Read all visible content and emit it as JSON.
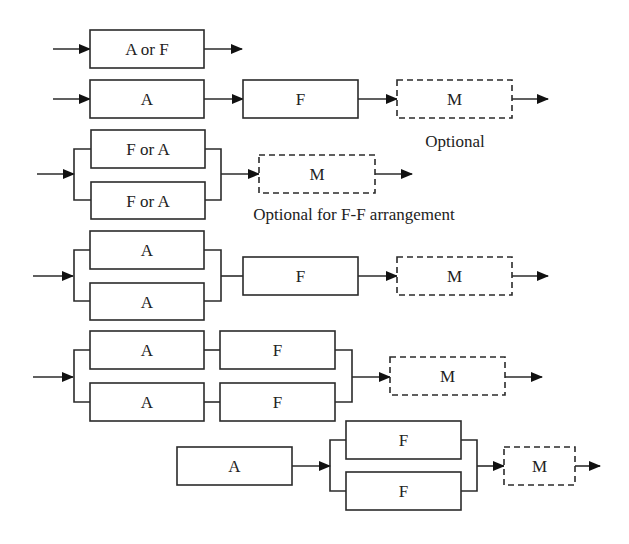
{
  "diagram": {
    "colors": {
      "stroke": "#2b2b2b",
      "text": "#222222",
      "background": "#ffffff"
    },
    "rows": [
      {
        "id": "row-1",
        "boxes": [
          {
            "id": "r1-a-or-f",
            "label": "A or F",
            "x": 90,
            "y": 30,
            "w": 114,
            "h": 38,
            "dashed": false
          }
        ],
        "wires": [
          {
            "pts": [
              [
                53,
                49
              ],
              [
                90,
                49
              ]
            ],
            "arrow": true
          },
          {
            "pts": [
              [
                204,
                49
              ],
              [
                242,
                49
              ]
            ],
            "arrow": true
          }
        ]
      },
      {
        "id": "row-2",
        "boxes": [
          {
            "id": "r2-a",
            "label": "A",
            "x": 90,
            "y": 80,
            "w": 114,
            "h": 38,
            "dashed": false
          },
          {
            "id": "r2-f",
            "label": "F",
            "x": 243,
            "y": 80,
            "w": 115,
            "h": 38,
            "dashed": false
          },
          {
            "id": "r2-m",
            "label": "M",
            "x": 397,
            "y": 80,
            "w": 115,
            "h": 38,
            "dashed": true
          }
        ],
        "wires": [
          {
            "pts": [
              [
                53,
                99
              ],
              [
                90,
                99
              ]
            ],
            "arrow": true
          },
          {
            "pts": [
              [
                204,
                99
              ],
              [
                243,
                99
              ]
            ],
            "arrow": true
          },
          {
            "pts": [
              [
                358,
                99
              ],
              [
                397,
                99
              ]
            ],
            "arrow": true
          },
          {
            "pts": [
              [
                512,
                99
              ],
              [
                548,
                99
              ]
            ],
            "arrow": true
          }
        ],
        "notes": [
          {
            "text": "Optional",
            "x": 455,
            "y": 147
          }
        ]
      },
      {
        "id": "row-3",
        "boxes": [
          {
            "id": "r3-f-or-a-top",
            "label": "F or A",
            "x": 91,
            "y": 130,
            "w": 114,
            "h": 38,
            "dashed": false
          },
          {
            "id": "r3-f-or-a-bottom",
            "label": "F or A",
            "x": 91,
            "y": 182,
            "w": 114,
            "h": 37,
            "dashed": false
          },
          {
            "id": "r3-m",
            "label": "M",
            "x": 259,
            "y": 155,
            "w": 116,
            "h": 38,
            "dashed": true
          }
        ],
        "wires": [
          {
            "pts": [
              [
                37,
                174
              ],
              [
                74,
                174
              ]
            ],
            "arrow": true
          },
          {
            "pts": [
              [
                91,
                149
              ],
              [
                74,
                149
              ],
              [
                74,
                200
              ],
              [
                91,
                200
              ]
            ],
            "arrow": false
          },
          {
            "pts": [
              [
                205,
                149
              ],
              [
                221,
                149
              ],
              [
                221,
                200
              ],
              [
                205,
                200
              ]
            ],
            "arrow": false
          },
          {
            "pts": [
              [
                221,
                174
              ],
              [
                259,
                174
              ]
            ],
            "arrow": true
          },
          {
            "pts": [
              [
                375,
                174
              ],
              [
                412,
                174
              ]
            ],
            "arrow": true
          }
        ],
        "notes": [
          {
            "text": "Optional for F-F arrangement",
            "x": 354,
            "y": 220
          }
        ]
      },
      {
        "id": "row-4",
        "boxes": [
          {
            "id": "r4-a-top",
            "label": "A",
            "x": 90,
            "y": 231,
            "w": 114,
            "h": 38,
            "dashed": false
          },
          {
            "id": "r4-a-bottom",
            "label": "A",
            "x": 90,
            "y": 283,
            "w": 114,
            "h": 37,
            "dashed": false
          },
          {
            "id": "r4-f",
            "label": "F",
            "x": 243,
            "y": 257,
            "w": 115,
            "h": 38,
            "dashed": false
          },
          {
            "id": "r4-m",
            "label": "M",
            "x": 397,
            "y": 257,
            "w": 115,
            "h": 38,
            "dashed": true
          }
        ],
        "wires": [
          {
            "pts": [
              [
                33,
                276
              ],
              [
                73,
                276
              ]
            ],
            "arrow": true
          },
          {
            "pts": [
              [
                90,
                250
              ],
              [
                74,
                250
              ],
              [
                74,
                301
              ],
              [
                90,
                301
              ]
            ],
            "arrow": false
          },
          {
            "pts": [
              [
                204,
                250
              ],
              [
                221,
                250
              ],
              [
                221,
                301
              ],
              [
                204,
                301
              ]
            ],
            "arrow": false
          },
          {
            "pts": [
              [
                221,
                276
              ],
              [
                243,
                276
              ]
            ],
            "arrow": false
          },
          {
            "pts": [
              [
                358,
                276
              ],
              [
                397,
                276
              ]
            ],
            "arrow": true
          },
          {
            "pts": [
              [
                512,
                276
              ],
              [
                548,
                276
              ]
            ],
            "arrow": true
          }
        ]
      },
      {
        "id": "row-5",
        "boxes": [
          {
            "id": "r5-a-top",
            "label": "A",
            "x": 90,
            "y": 331,
            "w": 114,
            "h": 38,
            "dashed": false
          },
          {
            "id": "r5-f-top",
            "label": "F",
            "x": 220,
            "y": 331,
            "w": 115,
            "h": 38,
            "dashed": false
          },
          {
            "id": "r5-a-bottom",
            "label": "A",
            "x": 90,
            "y": 383,
            "w": 114,
            "h": 38,
            "dashed": false
          },
          {
            "id": "r5-f-bottom",
            "label": "F",
            "x": 220,
            "y": 383,
            "w": 115,
            "h": 38,
            "dashed": false
          },
          {
            "id": "r5-m",
            "label": "M",
            "x": 390,
            "y": 357,
            "w": 115,
            "h": 38,
            "dashed": true
          }
        ],
        "wires": [
          {
            "pts": [
              [
                33,
                377
              ],
              [
                73,
                377
              ]
            ],
            "arrow": true
          },
          {
            "pts": [
              [
                90,
                350
              ],
              [
                74,
                350
              ],
              [
                74,
                402
              ],
              [
                90,
                402
              ]
            ],
            "arrow": false
          },
          {
            "pts": [
              [
                204,
                350
              ],
              [
                220,
                350
              ]
            ],
            "arrow": false
          },
          {
            "pts": [
              [
                204,
                402
              ],
              [
                220,
                402
              ]
            ],
            "arrow": false
          },
          {
            "pts": [
              [
                335,
                350
              ],
              [
                352,
                350
              ],
              [
                352,
                402
              ],
              [
                335,
                402
              ]
            ],
            "arrow": false
          },
          {
            "pts": [
              [
                352,
                377
              ],
              [
                390,
                377
              ]
            ],
            "arrow": true
          },
          {
            "pts": [
              [
                505,
                377
              ],
              [
                542,
                377
              ]
            ],
            "arrow": true
          }
        ]
      },
      {
        "id": "row-6",
        "boxes": [
          {
            "id": "r6-a",
            "label": "A",
            "x": 177,
            "y": 447,
            "w": 115,
            "h": 38,
            "dashed": false
          },
          {
            "id": "r6-f-top",
            "label": "F",
            "x": 346,
            "y": 421,
            "w": 115,
            "h": 38,
            "dashed": false
          },
          {
            "id": "r6-f-bottom",
            "label": "F",
            "x": 346,
            "y": 472,
            "w": 115,
            "h": 38,
            "dashed": false
          },
          {
            "id": "r6-m",
            "label": "M",
            "x": 504,
            "y": 447,
            "w": 71,
            "h": 38,
            "dashed": true
          }
        ],
        "wires": [
          {
            "pts": [
              [
                292,
                466
              ],
              [
                330,
                466
              ]
            ],
            "arrow": true
          },
          {
            "pts": [
              [
                346,
                440
              ],
              [
                330,
                440
              ],
              [
                330,
                491
              ],
              [
                346,
                491
              ]
            ],
            "arrow": false
          },
          {
            "pts": [
              [
                461,
                440
              ],
              [
                477,
                440
              ],
              [
                477,
                491
              ],
              [
                461,
                491
              ]
            ],
            "arrow": false
          },
          {
            "pts": [
              [
                477,
                466
              ],
              [
                504,
                466
              ]
            ],
            "arrow": true
          },
          {
            "pts": [
              [
                575,
                466
              ],
              [
                600,
                466
              ]
            ],
            "arrow": true
          }
        ]
      }
    ]
  }
}
